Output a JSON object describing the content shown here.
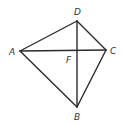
{
  "diagram": {
    "type": "geometry-figure",
    "points": {
      "A": {
        "label": "A",
        "x": 20,
        "y": 51
      },
      "B": {
        "label": "B",
        "x": 77,
        "y": 107
      },
      "C": {
        "label": "C",
        "x": 106,
        "y": 50
      },
      "D": {
        "label": "D",
        "x": 77,
        "y": 21
      },
      "F": {
        "label": "F",
        "x": 77,
        "y": 50
      }
    },
    "segments": [
      "AD",
      "DC",
      "CB",
      "BA",
      "AC",
      "DB"
    ],
    "colors": {
      "stroke": "#2b2b2b",
      "label": "#333333"
    }
  }
}
